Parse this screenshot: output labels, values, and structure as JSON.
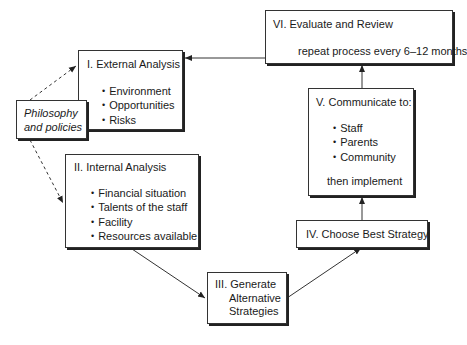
{
  "diagram": {
    "philosophy": {
      "line1": "Philosophy",
      "line2": "and policies"
    },
    "external": {
      "title": "I. External Analysis",
      "items": [
        "Environment",
        "Opportunities",
        "Risks"
      ]
    },
    "internal": {
      "title": "II. Internal Analysis",
      "items": [
        "Financial situation",
        "Talents of the staff",
        "Facility",
        "Resources available"
      ]
    },
    "generate": {
      "line1": "III. Generate",
      "line2": "Alternative",
      "line3": "Strategies"
    },
    "choose": {
      "title": "IV. Choose Best Strategy"
    },
    "communicate": {
      "title": "V. Communicate to:",
      "items": [
        "Staff",
        "Parents",
        "Community"
      ],
      "footer": "then implement"
    },
    "evaluate": {
      "title": "VI. Evaluate and Review",
      "note": "repeat process every 6–12 months"
    },
    "colors": {
      "stroke": "#333333",
      "background": "#ffffff"
    }
  }
}
